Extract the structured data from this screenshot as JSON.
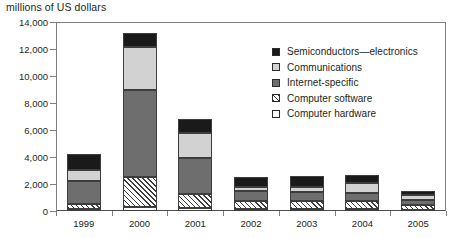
{
  "chart_data": {
    "type": "bar",
    "title": "millions of US dollars",
    "subtitle": "",
    "xlabel": "",
    "ylabel": "millions of US dollars",
    "stacked": true,
    "grid": false,
    "legend_position": "inside-top-right",
    "ylim": [
      0,
      14000
    ],
    "ytick_step": 2000,
    "ytick_labels": [
      "14,000",
      "12,000",
      "10,000",
      "8,000",
      "6,000",
      "4,000",
      "2,000",
      "0"
    ],
    "ytick_values": [
      14000,
      12000,
      10000,
      8000,
      6000,
      4000,
      2000,
      0
    ],
    "categories": [
      "1999",
      "2000",
      "2001",
      "2002",
      "2003",
      "2004",
      "2005"
    ],
    "series": [
      {
        "name": "Semiconductors—electronics",
        "fill": "solid-black",
        "color": "#1a1a1a",
        "values": [
          1150,
          1050,
          1000,
          750,
          800,
          600,
          350
        ]
      },
      {
        "name": "Communications",
        "fill": "light-gray",
        "color": "#d2d2d2",
        "values": [
          850,
          3150,
          1900,
          300,
          400,
          750,
          350
        ]
      },
      {
        "name": "Internet-specific",
        "fill": "medium-gray",
        "color": "#6e6e6e",
        "values": [
          1700,
          6450,
          2650,
          700,
          650,
          600,
          350
        ]
      },
      {
        "name": "Computer software",
        "fill": "diagonal-hatch",
        "color": "#ffffff",
        "values": [
          350,
          2250,
          1000,
          600,
          600,
          600,
          350
        ]
      },
      {
        "name": "Computer hardware",
        "fill": "open-white",
        "color": "#ffffff",
        "values": [
          150,
          300,
          250,
          150,
          150,
          150,
          100
        ]
      }
    ],
    "totals": [
      4200,
      13200,
      6800,
      2500,
      2600,
      2700,
      1500
    ]
  },
  "legend": {
    "items": [
      {
        "label": "Semiconductors—electronics",
        "swatch": "solid-black-swatch"
      },
      {
        "label": "Communications",
        "swatch": "light-gray-swatch"
      },
      {
        "label": "Internet-specific",
        "swatch": "medium-gray-swatch"
      },
      {
        "label": "Computer software",
        "swatch": "diagonal-hatch-swatch"
      },
      {
        "label": "Computer hardware",
        "swatch": "open-white-swatch"
      }
    ]
  },
  "colors": {
    "semiconductors": "#1a1a1a",
    "communications": "#d2d2d2",
    "internet_specific": "#6e6e6e",
    "software_hatch": "#3d3d3d",
    "hardware": "#ffffff",
    "axis": "#7f7f7f",
    "text": "#231f20"
  }
}
